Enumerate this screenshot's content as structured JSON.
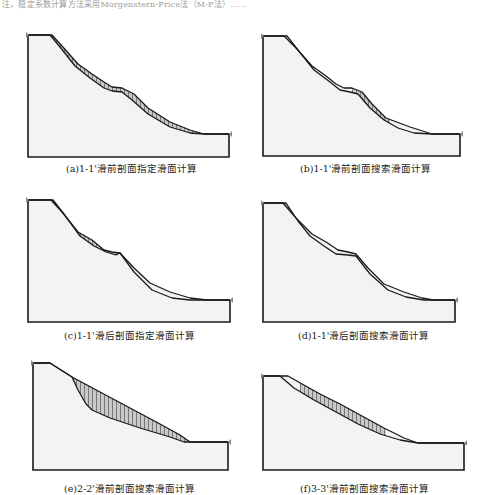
{
  "page": {
    "top_fragment": "注，稳定系数计算方法采用Morgenstern-Price法（M-P法）……"
  },
  "style": {
    "ground_fill": "#f3f3f3",
    "outline": "#1a1a1a",
    "hatch_fill": "#c9c9c9",
    "hatch_line": "#555555",
    "marker": "#888888"
  },
  "panels": [
    {
      "id": "a",
      "caption": "(a)1-1'滑前剖面指定滑面计算",
      "caption_pos": [
        66,
        161
      ],
      "frame": {
        "left": 28,
        "top": 35,
        "right": 229,
        "bottom": 157
      },
      "ground": [
        [
          28,
          35
        ],
        [
          52,
          35
        ],
        [
          62,
          46
        ],
        [
          78,
          64
        ],
        [
          92,
          74
        ],
        [
          104,
          82
        ],
        [
          112,
          87
        ],
        [
          122,
          88
        ],
        [
          134,
          94
        ],
        [
          148,
          108
        ],
        [
          170,
          122
        ],
        [
          190,
          130
        ],
        [
          204,
          134
        ],
        [
          229,
          134
        ]
      ],
      "slip": [
        [
          28,
          35
        ],
        [
          50,
          35
        ],
        [
          60,
          47
        ],
        [
          75,
          66
        ],
        [
          90,
          78
        ],
        [
          104,
          88
        ],
        [
          112,
          91
        ],
        [
          122,
          92
        ],
        [
          132,
          100
        ],
        [
          148,
          114
        ],
        [
          170,
          127
        ],
        [
          190,
          133
        ],
        [
          204,
          134
        ],
        [
          229,
          134
        ]
      ],
      "hatch_range": [
        50,
        204
      ],
      "mode": "above"
    },
    {
      "id": "b",
      "caption": "(b)1-1'滑前剖面搜索滑面计算",
      "caption_pos": [
        300,
        161
      ],
      "frame": {
        "left": 263,
        "top": 36,
        "right": 460,
        "bottom": 156
      },
      "ground": [
        [
          263,
          36
        ],
        [
          284,
          36
        ],
        [
          296,
          48
        ],
        [
          312,
          66
        ],
        [
          326,
          76
        ],
        [
          336,
          84
        ],
        [
          344,
          88
        ],
        [
          352,
          88
        ],
        [
          362,
          92
        ],
        [
          372,
          104
        ],
        [
          386,
          118
        ],
        [
          410,
          127
        ],
        [
          432,
          134
        ],
        [
          460,
          134
        ]
      ],
      "slip": [
        [
          263,
          36
        ],
        [
          287,
          36
        ],
        [
          298,
          50
        ],
        [
          314,
          70
        ],
        [
          330,
          82
        ],
        [
          340,
          90
        ],
        [
          350,
          92
        ],
        [
          358,
          94
        ],
        [
          370,
          108
        ],
        [
          384,
          120
        ],
        [
          398,
          128
        ],
        [
          414,
          133
        ],
        [
          432,
          134
        ],
        [
          460,
          134
        ]
      ],
      "hatch_range": [
        352,
        390
      ],
      "mode": "between"
    },
    {
      "id": "c",
      "caption": "(c)1-1'滑后剖面指定滑面计算",
      "caption_pos": [
        64,
        328
      ],
      "frame": {
        "left": 28,
        "top": 200,
        "right": 230,
        "bottom": 322
      },
      "ground": [
        [
          28,
          200
        ],
        [
          51,
          200
        ],
        [
          62,
          212
        ],
        [
          78,
          232
        ],
        [
          92,
          240
        ],
        [
          104,
          250
        ],
        [
          112,
          252
        ],
        [
          120,
          253
        ],
        [
          134,
          268
        ],
        [
          150,
          283
        ],
        [
          170,
          292
        ],
        [
          190,
          298
        ],
        [
          207,
          300
        ],
        [
          230,
          300
        ]
      ],
      "slip": [
        [
          28,
          200
        ],
        [
          53,
          200
        ],
        [
          64,
          214
        ],
        [
          80,
          236
        ],
        [
          94,
          246
        ],
        [
          106,
          252
        ],
        [
          116,
          255
        ],
        [
          120,
          253
        ],
        [
          134,
          272
        ],
        [
          152,
          290
        ],
        [
          172,
          298
        ],
        [
          190,
          300
        ],
        [
          207,
          300
        ],
        [
          230,
          300
        ]
      ],
      "hatch_range": [
        51,
        120
      ],
      "mode": "between"
    },
    {
      "id": "d",
      "caption": "(d)1-1'滑后剖面搜索滑面计算",
      "caption_pos": [
        298,
        328
      ],
      "frame": {
        "left": 263,
        "top": 203,
        "right": 455,
        "bottom": 322
      },
      "ground": [
        [
          263,
          203
        ],
        [
          283,
          203
        ],
        [
          296,
          218
        ],
        [
          312,
          234
        ],
        [
          326,
          242
        ],
        [
          338,
          250
        ],
        [
          348,
          252
        ],
        [
          356,
          254
        ],
        [
          368,
          268
        ],
        [
          384,
          284
        ],
        [
          404,
          292
        ],
        [
          422,
          298
        ],
        [
          433,
          300
        ],
        [
          455,
          300
        ]
      ],
      "slip": [
        [
          263,
          203
        ],
        [
          286,
          203
        ],
        [
          298,
          221
        ],
        [
          310,
          236
        ],
        [
          324,
          246
        ],
        [
          336,
          254
        ],
        [
          348,
          255
        ],
        [
          356,
          256
        ],
        [
          370,
          274
        ],
        [
          388,
          290
        ],
        [
          406,
          297
        ],
        [
          424,
          300
        ],
        [
          433,
          300
        ],
        [
          455,
          300
        ]
      ],
      "hatch_range": [
        283,
        300
      ],
      "mode": "between"
    },
    {
      "id": "e",
      "caption": "(e)2-2'滑前剖面搜索滑面计算",
      "caption_pos": [
        64,
        481
      ],
      "frame": {
        "left": 33,
        "top": 363,
        "right": 228,
        "bottom": 470
      },
      "ground": [
        [
          33,
          363
        ],
        [
          50,
          363
        ],
        [
          72,
          377
        ],
        [
          100,
          392
        ],
        [
          130,
          408
        ],
        [
          160,
          424
        ],
        [
          180,
          435
        ],
        [
          190,
          442
        ],
        [
          228,
          442
        ]
      ],
      "slip": [
        [
          33,
          363
        ],
        [
          50,
          363
        ],
        [
          72,
          377
        ],
        [
          78,
          390
        ],
        [
          86,
          404
        ],
        [
          92,
          410
        ],
        [
          110,
          418
        ],
        [
          140,
          428
        ],
        [
          170,
          437
        ],
        [
          184,
          442
        ],
        [
          228,
          442
        ]
      ],
      "hatch_range": [
        72,
        190
      ],
      "mode": "between"
    },
    {
      "id": "f",
      "caption": "(f)3-3'滑前剖面搜索滑面计算",
      "caption_pos": [
        300,
        481
      ],
      "frame": {
        "left": 263,
        "top": 376,
        "right": 464,
        "bottom": 470
      },
      "ground": [
        [
          263,
          376
        ],
        [
          288,
          376
        ],
        [
          302,
          384
        ],
        [
          320,
          394
        ],
        [
          340,
          404
        ],
        [
          362,
          416
        ],
        [
          384,
          428
        ],
        [
          404,
          438
        ],
        [
          418,
          443
        ],
        [
          464,
          443
        ]
      ],
      "slip": [
        [
          263,
          376
        ],
        [
          280,
          376
        ],
        [
          294,
          388
        ],
        [
          314,
          400
        ],
        [
          336,
          412
        ],
        [
          358,
          424
        ],
        [
          380,
          434
        ],
        [
          400,
          440
        ],
        [
          418,
          443
        ],
        [
          464,
          443
        ]
      ],
      "hatch_range": [
        300,
        386
      ],
      "mode": "between"
    }
  ]
}
